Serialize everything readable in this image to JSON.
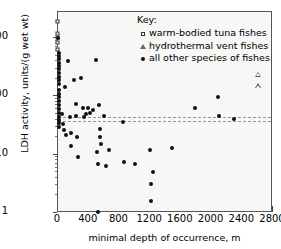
{
  "chart_data": {
    "type": "scatter",
    "title": "",
    "xlabel": "minimal depth of occurrence, m",
    "ylabel": "LDH activity, units/(g wet wt)",
    "xlim": [
      0,
      2800
    ],
    "ylim": [
      1,
      2800
    ],
    "yscale": "log",
    "xticks": [
      0,
      400,
      800,
      1200,
      1600,
      2000,
      2400,
      2800
    ],
    "yticks": [
      1,
      10,
      100,
      1000
    ],
    "grid": false,
    "legend_position": "top-right",
    "legend_title": "Key:",
    "reference_lines": [
      {
        "y": 45,
        "style": "dashed",
        "color": "#999"
      },
      {
        "y": 38,
        "style": "dashed",
        "color": "#999"
      }
    ],
    "series": [
      {
        "name": "warm-bodied tuna fishes",
        "marker": "open-square",
        "points": [
          {
            "x": 0,
            "y": 1850
          },
          {
            "x": 0,
            "y": 1180
          },
          {
            "x": 0,
            "y": 1000
          },
          {
            "x": 0,
            "y": 820
          },
          {
            "x": 0,
            "y": 620
          }
        ]
      },
      {
        "name": "hydrothermal vent fishes",
        "marker": "open-triangle",
        "points": [
          {
            "x": 2600,
            "y": 235
          },
          {
            "x": 2600,
            "y": 150
          }
        ]
      },
      {
        "name": "all other species of fishes",
        "marker": "filled-circle",
        "points": [
          {
            "x": 5,
            "y": 1020
          },
          {
            "x": 8,
            "y": 560
          },
          {
            "x": 8,
            "y": 500
          },
          {
            "x": 10,
            "y": 430
          },
          {
            "x": 8,
            "y": 380
          },
          {
            "x": 12,
            "y": 330
          },
          {
            "x": 8,
            "y": 290
          },
          {
            "x": 14,
            "y": 250
          },
          {
            "x": 8,
            "y": 215
          },
          {
            "x": 10,
            "y": 190
          },
          {
            "x": 8,
            "y": 160
          },
          {
            "x": 12,
            "y": 130
          },
          {
            "x": 8,
            "y": 110
          },
          {
            "x": 10,
            "y": 96
          },
          {
            "x": 8,
            "y": 82
          },
          {
            "x": 14,
            "y": 70
          },
          {
            "x": 8,
            "y": 60
          },
          {
            "x": 10,
            "y": 52
          },
          {
            "x": 8,
            "y": 45
          },
          {
            "x": 12,
            "y": 40
          },
          {
            "x": 8,
            "y": 35
          },
          {
            "x": 10,
            "y": 30
          },
          {
            "x": 55,
            "y": 50
          },
          {
            "x": 60,
            "y": 33
          },
          {
            "x": 75,
            "y": 26
          },
          {
            "x": 95,
            "y": 145
          },
          {
            "x": 110,
            "y": 22
          },
          {
            "x": 130,
            "y": 410
          },
          {
            "x": 150,
            "y": 44
          },
          {
            "x": 165,
            "y": 24
          },
          {
            "x": 175,
            "y": 14
          },
          {
            "x": 210,
            "y": 190
          },
          {
            "x": 235,
            "y": 75
          },
          {
            "x": 240,
            "y": 47
          },
          {
            "x": 250,
            "y": 20
          },
          {
            "x": 255,
            "y": 9
          },
          {
            "x": 300,
            "y": 210
          },
          {
            "x": 330,
            "y": 63
          },
          {
            "x": 345,
            "y": 45
          },
          {
            "x": 360,
            "y": 50
          },
          {
            "x": 395,
            "y": 62
          },
          {
            "x": 420,
            "y": 52
          },
          {
            "x": 460,
            "y": 58
          },
          {
            "x": 500,
            "y": 420
          },
          {
            "x": 510,
            "y": 11
          },
          {
            "x": 515,
            "y": 7
          },
          {
            "x": 525,
            "y": 1.05
          },
          {
            "x": 540,
            "y": 70
          },
          {
            "x": 545,
            "y": 28
          },
          {
            "x": 550,
            "y": 20
          },
          {
            "x": 555,
            "y": 15
          },
          {
            "x": 600,
            "y": 47
          },
          {
            "x": 620,
            "y": 6.3
          },
          {
            "x": 660,
            "y": 12
          },
          {
            "x": 840,
            "y": 37
          },
          {
            "x": 860,
            "y": 7.5
          },
          {
            "x": 1000,
            "y": 7
          },
          {
            "x": 1195,
            "y": 12
          },
          {
            "x": 1205,
            "y": 3.1
          },
          {
            "x": 1210,
            "y": 1.6
          },
          {
            "x": 1240,
            "y": 5
          },
          {
            "x": 1490,
            "y": 13
          },
          {
            "x": 1780,
            "y": 63
          },
          {
            "x": 2090,
            "y": 97
          },
          {
            "x": 2100,
            "y": 47
          },
          {
            "x": 2290,
            "y": 41
          }
        ]
      }
    ]
  },
  "legend": {
    "title": "Key:",
    "items": [
      {
        "label": "warm-bodied tuna fishes",
        "glyph": "open-square-icon"
      },
      {
        "label": "hydrothermal vent fishes",
        "glyph": "open-triangle-icon"
      },
      {
        "label": "all other species of fishes",
        "glyph": "filled-circle-icon"
      }
    ]
  },
  "axes": {
    "x_title": "minimal depth of occurrence, m",
    "y_title": "LDH activity, units/(g wet wt)",
    "x_tick_labels": [
      "0",
      "400",
      "800",
      "1200",
      "1600",
      "2000",
      "2400",
      "2800"
    ],
    "y_tick_labels": [
      "1",
      "10",
      "100",
      "1000"
    ]
  }
}
